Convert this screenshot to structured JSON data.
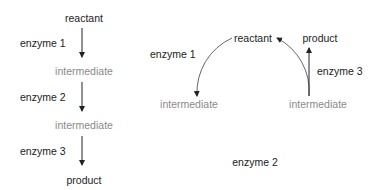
{
  "linear_pathway": {
    "nodes": [
      "reactant",
      "intermediate",
      "intermediate",
      "product"
    ],
    "enzymes": [
      "enzyme 1",
      "enzyme 2",
      "enzyme 3"
    ]
  },
  "cyclic_pathway": {
    "reactant": "reactant",
    "intermediate_left": "intermediate",
    "intermediate_right": "intermediate",
    "product": "product",
    "enzymes": [
      "enzyme 1",
      "enzyme 2",
      "enzyme 3"
    ]
  },
  "colors": {
    "substrate_text": "#222222",
    "intermediate_text": "#8a8a8a",
    "arrow": "#222222",
    "arc": "#555555"
  }
}
